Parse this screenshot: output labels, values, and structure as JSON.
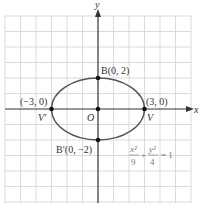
{
  "diagram": {
    "axes": {
      "x_label": "x",
      "y_label": "y"
    },
    "grid": {
      "x_min": -6,
      "x_max": 6,
      "y_min": -6,
      "y_max": 6,
      "step": 1
    },
    "ellipse": {
      "a": 3,
      "b": 2,
      "center": [
        0,
        0
      ]
    },
    "points": [
      {
        "name": "B",
        "coords": "B(0, 2)",
        "x": 0,
        "y": 2
      },
      {
        "name": "B'",
        "coords": "B'(0, −2)",
        "x": 0,
        "y": -2
      },
      {
        "name": "V",
        "coords": "(3, 0)",
        "x": 3,
        "y": 0
      },
      {
        "name": "V'",
        "coords": "(−3, 0)",
        "x": -3,
        "y": 0
      },
      {
        "name": "O",
        "x": 0,
        "y": 0
      }
    ],
    "labels": {
      "B": "B(0, 2)",
      "Bp": "B′(0, −2)",
      "V_coord": "(3, 0)",
      "Vp_coord": "(−3, 0)",
      "V": "V",
      "Vp": "V′",
      "O": "O"
    },
    "equation": {
      "x_num": "x²",
      "x_den": "9",
      "plus": "+",
      "y_num": "y²",
      "y_den": "4",
      "rhs": "= 1"
    },
    "colors": {
      "grid": "#cfcfcf",
      "axis": "#333333",
      "curve": "#555555",
      "point": "#111111",
      "equation": "#777777"
    }
  }
}
